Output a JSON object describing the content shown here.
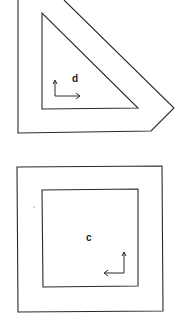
{
  "diagram": {
    "figures": [
      {
        "id": "top",
        "label": "d",
        "outer_shape": "truncated-triangle-frame",
        "inner_shape": "right-triangle",
        "axis_arrows": [
          "up",
          "right"
        ]
      },
      {
        "id": "bottom",
        "label": "c",
        "outer_shape": "square-frame",
        "inner_shape": "square",
        "axis_arrows": [
          "up",
          "left"
        ]
      }
    ],
    "colors": {
      "line": "#2a2a2a",
      "background": "#ffffff"
    }
  }
}
